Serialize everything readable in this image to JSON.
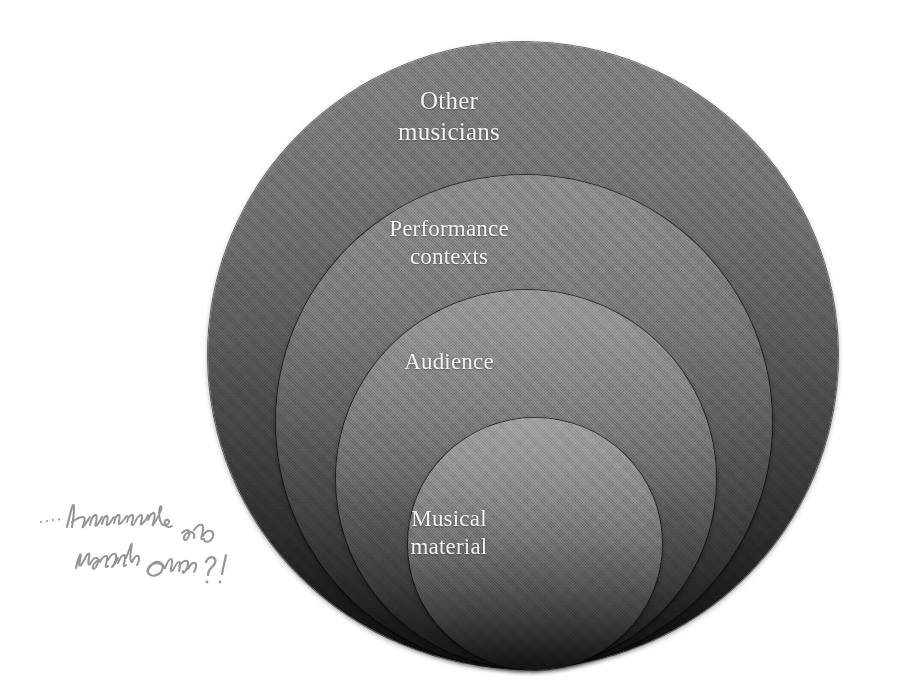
{
  "figure": {
    "type": "nested-circles-diagram",
    "background_color": "#ffffff",
    "label_color": "#f2f2f0",
    "gradient_top_color": "#8a8a8a",
    "gradient_bottom_color": "#0d0d0d",
    "annotation_ink_color": "#6f6d6b"
  },
  "circles": [
    {
      "id": "other-musicians",
      "label": "Other\nmusicians",
      "level": 1,
      "size_rank": "largest"
    },
    {
      "id": "performance-contexts",
      "label": "Performance\ncontexts",
      "level": 2,
      "size_rank": "second"
    },
    {
      "id": "audience",
      "label": "Audience",
      "level": 3,
      "size_rank": "third"
    },
    {
      "id": "musical-material",
      "label": "Musical\nmaterial",
      "level": 4,
      "size_rank": "smallest"
    }
  ],
  "annotation": {
    "kind": "handwritten-pencil-note",
    "transcription": "... instruments also material audio ? !",
    "position": "lower-left margin"
  }
}
